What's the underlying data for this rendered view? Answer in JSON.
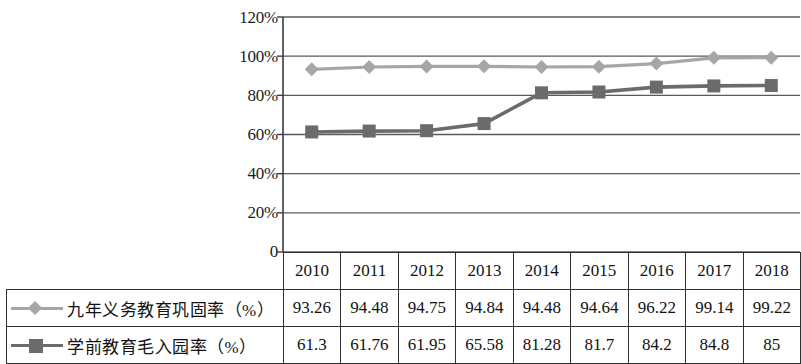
{
  "chart_data": {
    "type": "line",
    "title": "",
    "xlabel": "",
    "ylabel": "",
    "categories": [
      "2010",
      "2011",
      "2012",
      "2013",
      "2014",
      "2015",
      "2016",
      "2017",
      "2018"
    ],
    "ylim": [
      0,
      120
    ],
    "ytick_labels": [
      "120%",
      "100%",
      "80%",
      "60%",
      "40%",
      "20%",
      "0"
    ],
    "ytick_values": [
      120,
      100,
      80,
      60,
      40,
      20,
      0
    ],
    "grid": true,
    "legend_position": "table-row-labels",
    "series": [
      {
        "name": "九年义务教育巩固率（%）",
        "marker": "diamond",
        "color": "#a6a6a6",
        "values": [
          93.26,
          94.48,
          94.75,
          94.84,
          94.48,
          94.64,
          96.22,
          99.14,
          99.22
        ]
      },
      {
        "name": "学前教育毛入园率（%）",
        "marker": "square",
        "color": "#6b6b6b",
        "values": [
          61.3,
          61.76,
          61.95,
          65.58,
          81.28,
          81.7,
          84.2,
          84.8,
          85
        ]
      }
    ]
  },
  "table": {
    "year_header": [
      "2010",
      "2011",
      "2012",
      "2013",
      "2014",
      "2015",
      "2016",
      "2017",
      "2018"
    ],
    "rows": [
      {
        "label": "九年义务教育巩固率（%）",
        "marker": "diamond",
        "values": [
          "93.26",
          "94.48",
          "94.75",
          "94.84",
          "94.48",
          "94.64",
          "96.22",
          "99.14",
          "99.22"
        ]
      },
      {
        "label": "学前教育毛入园率（%）",
        "marker": "square",
        "values": [
          "61.3",
          "61.76",
          "61.95",
          "65.58",
          "81.28",
          "81.7",
          "84.2",
          "84.8",
          "85"
        ]
      }
    ]
  },
  "colors": {
    "series1": "#a6a6a6",
    "series2": "#6b6b6b",
    "axis": "#3c3c3c",
    "grid": "#5a5a5a"
  }
}
